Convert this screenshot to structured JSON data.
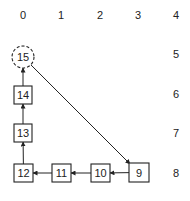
{
  "column_labels": [
    {
      "text": "0",
      "x": 23
    },
    {
      "text": "1",
      "x": 61
    },
    {
      "text": "2",
      "x": 100
    },
    {
      "text": "3",
      "x": 138
    },
    {
      "text": "4",
      "x": 176
    }
  ],
  "row_labels": [
    {
      "text": "5",
      "y": 57
    },
    {
      "text": "6",
      "y": 97
    },
    {
      "text": "7",
      "y": 136
    },
    {
      "text": "8",
      "y": 176
    }
  ],
  "nodes": [
    {
      "id": "15",
      "label": "15",
      "shape": "dashed-circle",
      "cx": 23,
      "cy": 57,
      "r": 11
    },
    {
      "id": "14",
      "label": "14",
      "shape": "box",
      "x": 14,
      "y": 86,
      "w": 18,
      "h": 18
    },
    {
      "id": "13",
      "label": "13",
      "shape": "box",
      "x": 14,
      "y": 124,
      "w": 18,
      "h": 18
    },
    {
      "id": "12",
      "label": "12",
      "shape": "box",
      "x": 14,
      "y": 164,
      "w": 19,
      "h": 18
    },
    {
      "id": "11",
      "label": "11",
      "shape": "box",
      "x": 52,
      "y": 164,
      "w": 19,
      "h": 18
    },
    {
      "id": "10",
      "label": "10",
      "shape": "box",
      "x": 91,
      "y": 164,
      "w": 19,
      "h": 18
    },
    {
      "id": "9",
      "label": "9",
      "shape": "box",
      "x": 129,
      "y": 163,
      "w": 20,
      "h": 19
    }
  ],
  "edges": [
    {
      "from": "9",
      "to": "10"
    },
    {
      "from": "10",
      "to": "11"
    },
    {
      "from": "11",
      "to": "12"
    },
    {
      "from": "12",
      "to": "13"
    },
    {
      "from": "13",
      "to": "14"
    },
    {
      "from": "14",
      "to": "15"
    },
    {
      "from": "15",
      "to": "9"
    }
  ],
  "colors": {
    "stroke": "#222222",
    "background": "#ffffff"
  }
}
